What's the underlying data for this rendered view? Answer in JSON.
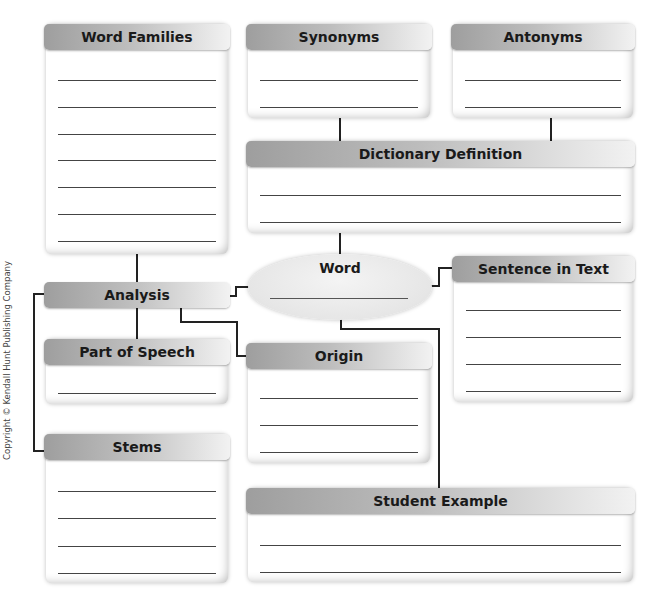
{
  "diagram": {
    "boxes": {
      "word_families": {
        "title": "Word Families",
        "lines": 7
      },
      "synonyms": {
        "title": "Synonyms",
        "lines": 2
      },
      "antonyms": {
        "title": "Antonyms",
        "lines": 2
      },
      "dictionary_definition": {
        "title": "Dictionary Definition",
        "lines": 2
      },
      "word": {
        "title": "Word",
        "lines": 1
      },
      "analysis": {
        "title": "Analysis",
        "lines": 0
      },
      "sentence_in_text": {
        "title": "Sentence in Text",
        "lines": 4
      },
      "part_of_speech": {
        "title": "Part of Speech",
        "lines": 1
      },
      "origin": {
        "title": "Origin",
        "lines": 3
      },
      "stems": {
        "title": "Stems",
        "lines": 4
      },
      "student_example": {
        "title": "Student Example",
        "lines": 2
      }
    },
    "copyright": "Copyright © Kendall Hunt Publishing Company"
  },
  "colors": {
    "header_dark": "#9e9e9e",
    "header_light": "#f2f2f2",
    "line": "#444444",
    "connector": "#222222"
  }
}
